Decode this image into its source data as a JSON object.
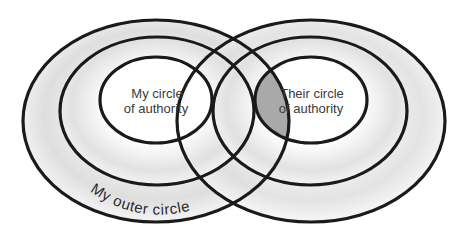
{
  "diagram": {
    "labels": {
      "my_inner_line1": "My circle",
      "my_inner_line2": "of authority",
      "their_inner_line1": "Their circle",
      "their_inner_line2": "of authority",
      "my_outer": "My outer circle"
    },
    "colors": {
      "stroke": "#1a1a1a",
      "background": "#ffffff",
      "ring_gradient_light": "#ffffff",
      "ring_gradient_dark": "#d9d9d9",
      "overlap_highlight": "#a8a8a8"
    },
    "shapes": {
      "left_outer": {
        "cx": 156,
        "cy": 121,
        "rx": 133,
        "ry": 101
      },
      "left_middle": {
        "cx": 157,
        "cy": 111,
        "rx": 97,
        "ry": 74
      },
      "left_inner": {
        "cx": 156,
        "cy": 100,
        "rx": 56,
        "ry": 43
      },
      "right_outer": {
        "cx": 311,
        "cy": 121,
        "rx": 134,
        "ry": 101
      },
      "right_middle": {
        "cx": 310,
        "cy": 111,
        "rx": 97,
        "ry": 74
      },
      "right_inner": {
        "cx": 311,
        "cy": 100,
        "rx": 56,
        "ry": 43
      }
    },
    "highlighted_region": "intersection of their circle of authority and my outer circle"
  }
}
